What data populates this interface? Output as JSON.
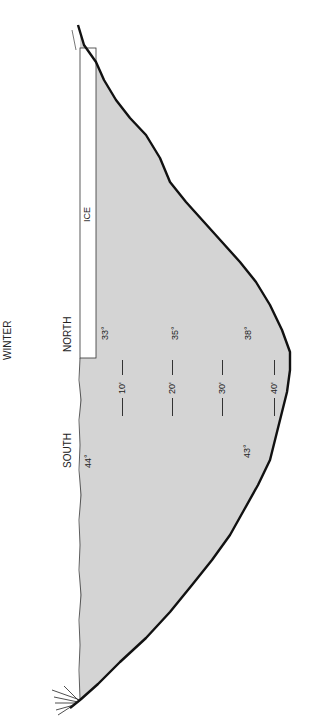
{
  "title": "WINTER",
  "orientation": "rotated 90 degrees counterclockwise",
  "regions": {
    "north": "NORTH",
    "south": "SOUTH",
    "ice": "ICE"
  },
  "temperatures": {
    "north": [
      "33°",
      "35°",
      "38°"
    ],
    "south": [
      "44°",
      "43°"
    ]
  },
  "depth_markers": [
    "10'",
    "20'",
    "30'",
    "40'"
  ],
  "colors": {
    "water": "#d4d4d4",
    "outline": "#111111",
    "ice": "#ffffff",
    "background": "#ffffff"
  }
}
